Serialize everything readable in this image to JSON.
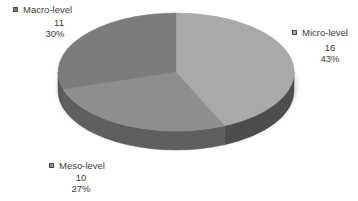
{
  "chart_data": {
    "type": "pie",
    "style": "3d",
    "title": "",
    "direction": "clockwise",
    "start_angle_deg": 0,
    "legend_position": "none",
    "label_format": "name, value, percent",
    "background_color": "#ffffff",
    "shadow_color": "#c9c9c9",
    "text_color": "#3c3c3c",
    "slices": [
      {
        "label": "Micro-level",
        "value": 16,
        "pct": "43%",
        "color": "#a9a9a9",
        "side_color": "#4d4d4d"
      },
      {
        "label": "Meso-level",
        "value": 10,
        "pct": "27%",
        "color": "#8e8e8e",
        "side_color": "#5f5f5f"
      },
      {
        "label": "Macro-level",
        "value": 11,
        "pct": "30%",
        "color": "#7c7c7c",
        "side_color": "#585858"
      }
    ]
  }
}
